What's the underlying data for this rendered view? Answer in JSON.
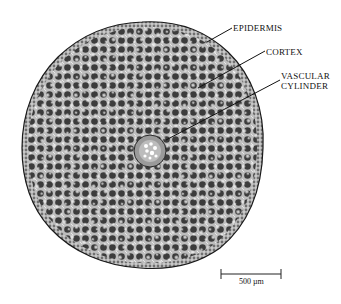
{
  "figure": {
    "type": "root cross-section micrograph",
    "labels": [
      {
        "id": "epidermis",
        "text": "EPIDERMIS"
      },
      {
        "id": "cortex",
        "text": "CORTEX"
      },
      {
        "id": "vascular_line1",
        "text": "VASCULAR"
      },
      {
        "id": "vascular_line2",
        "text": "CYLINDER"
      }
    ],
    "scale_bar": {
      "label": "500 µm"
    }
  },
  "colors": {
    "background": "#ffffff",
    "tissue_dark": "#3a3a3a",
    "tissue_mid": "#7a7a7a",
    "tissue_light": "#d8d8d8",
    "outline": "#1a1a1a"
  }
}
